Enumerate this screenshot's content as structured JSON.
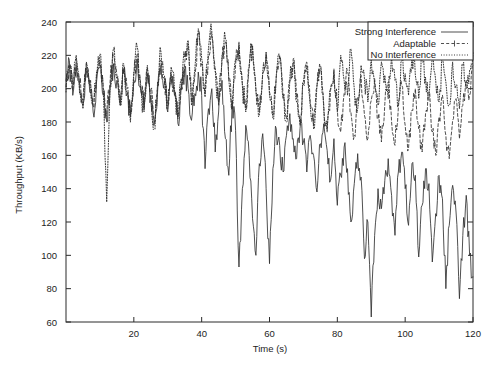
{
  "chart_data": {
    "type": "line",
    "title": "",
    "xlabel": "Time (s)",
    "ylabel": "Throughput (KB/s)",
    "xlim": [
      0,
      120
    ],
    "ylim": [
      60,
      240
    ],
    "xticks": [
      20,
      40,
      60,
      80,
      100,
      120
    ],
    "yticks": [
      60,
      80,
      100,
      120,
      140,
      160,
      180,
      200,
      220,
      240
    ],
    "grid": false,
    "legend_position": "top-right",
    "series": [
      {
        "name": "Strong Interference",
        "style": "solid",
        "color": "#303030",
        "x": [
          0,
          1,
          2,
          3,
          4,
          5,
          6,
          7,
          8,
          9,
          10,
          11,
          12,
          13,
          14,
          15,
          16,
          17,
          18,
          19,
          20,
          21,
          22,
          23,
          24,
          25,
          26,
          27,
          28,
          29,
          30,
          31,
          32,
          33,
          34,
          35,
          36,
          37,
          38,
          39,
          40,
          41,
          42,
          43,
          44,
          45,
          46,
          47,
          48,
          49,
          50,
          51,
          52,
          53,
          54,
          55,
          56,
          57,
          58,
          59,
          60,
          61,
          62,
          63,
          64,
          65,
          66,
          67,
          68,
          69,
          70,
          71,
          72,
          73,
          74,
          75,
          76,
          77,
          78,
          79,
          80,
          81,
          82,
          83,
          84,
          85,
          86,
          87,
          88,
          89,
          90,
          91,
          92,
          93,
          94,
          95,
          96,
          97,
          98,
          99,
          100,
          101,
          102,
          103,
          104,
          105,
          106,
          107,
          108,
          109,
          110,
          111,
          112,
          113,
          114,
          115,
          116,
          117,
          118,
          119,
          120
        ],
        "values": [
          205,
          217,
          196,
          214,
          200,
          190,
          211,
          198,
          186,
          204,
          213,
          196,
          180,
          200,
          215,
          205,
          190,
          209,
          197,
          183,
          205,
          218,
          200,
          188,
          209,
          196,
          178,
          198,
          214,
          203,
          186,
          207,
          196,
          179,
          199,
          212,
          200,
          181,
          197,
          210,
          196,
          152,
          188,
          200,
          162,
          186,
          205,
          170,
          148,
          193,
          175,
          93,
          140,
          178,
          160,
          122,
          100,
          155,
          173,
          140,
          95,
          152,
          176,
          166,
          150,
          172,
          185,
          170,
          158,
          176,
          168,
          150,
          172,
          160,
          138,
          167,
          179,
          163,
          145,
          170,
          130,
          148,
          165,
          152,
          120,
          143,
          161,
          147,
          98,
          120,
          63,
          112,
          140,
          128,
          145,
          158,
          136,
          112,
          150,
          162,
          140,
          118,
          155,
          148,
          99,
          130,
          152,
          143,
          96,
          125,
          148,
          134,
          80,
          118,
          142,
          126,
          74,
          112,
          136,
          100,
          87
        ]
      },
      {
        "name": "Adaptable",
        "style": "dashed",
        "color": "#303030",
        "x": [
          0,
          1,
          2,
          3,
          4,
          5,
          6,
          7,
          8,
          9,
          10,
          11,
          12,
          13,
          14,
          15,
          16,
          17,
          18,
          19,
          20,
          21,
          22,
          23,
          24,
          25,
          26,
          27,
          28,
          29,
          30,
          31,
          32,
          33,
          34,
          35,
          36,
          37,
          38,
          39,
          40,
          41,
          42,
          43,
          44,
          45,
          46,
          47,
          48,
          49,
          50,
          51,
          52,
          53,
          54,
          55,
          56,
          57,
          58,
          59,
          60,
          61,
          62,
          63,
          64,
          65,
          66,
          67,
          68,
          69,
          70,
          71,
          72,
          73,
          74,
          75,
          76,
          77,
          78,
          79,
          80,
          81,
          82,
          83,
          84,
          85,
          86,
          87,
          88,
          89,
          90,
          91,
          92,
          93,
          94,
          95,
          96,
          97,
          98,
          99,
          100,
          101,
          102,
          103,
          104,
          105,
          106,
          107,
          108,
          109,
          110,
          111,
          112,
          113,
          114,
          115,
          116,
          117,
          118,
          119,
          120
        ],
        "values": [
          201,
          213,
          199,
          218,
          203,
          193,
          215,
          202,
          190,
          208,
          217,
          200,
          184,
          204,
          219,
          208,
          192,
          212,
          200,
          186,
          208,
          221,
          203,
          191,
          212,
          199,
          181,
          201,
          217,
          206,
          190,
          210,
          199,
          183,
          203,
          215,
          227,
          192,
          208,
          233,
          215,
          197,
          220,
          231,
          210,
          192,
          217,
          228,
          205,
          190,
          214,
          226,
          203,
          188,
          212,
          224,
          200,
          186,
          209,
          222,
          198,
          184,
          207,
          220,
          196,
          182,
          205,
          218,
          194,
          180,
          203,
          216,
          192,
          178,
          201,
          214,
          190,
          176,
          199,
          212,
          188,
          174,
          197,
          210,
          186,
          172,
          195,
          208,
          184,
          170,
          193,
          206,
          182,
          168,
          191,
          204,
          180,
          166,
          189,
          202,
          178,
          164,
          187,
          200,
          176,
          162,
          185,
          198,
          174,
          160,
          183,
          196,
          172,
          158,
          181,
          194,
          170,
          190,
          205,
          196,
          214
        ]
      },
      {
        "name": "No Interference",
        "style": "dotted",
        "color": "#303030",
        "x": [
          0,
          1,
          2,
          3,
          4,
          5,
          6,
          7,
          8,
          9,
          10,
          11,
          12,
          13,
          14,
          15,
          16,
          17,
          18,
          19,
          20,
          21,
          22,
          23,
          24,
          25,
          26,
          27,
          28,
          29,
          30,
          31,
          32,
          33,
          34,
          35,
          36,
          37,
          38,
          39,
          40,
          41,
          42,
          43,
          44,
          45,
          46,
          47,
          48,
          49,
          50,
          51,
          52,
          53,
          54,
          55,
          56,
          57,
          58,
          59,
          60,
          61,
          62,
          63,
          64,
          65,
          66,
          67,
          68,
          69,
          70,
          71,
          72,
          73,
          74,
          75,
          76,
          77,
          78,
          79,
          80,
          81,
          82,
          83,
          84,
          85,
          86,
          87,
          88,
          89,
          90,
          91,
          92,
          93,
          94,
          95,
          96,
          97,
          98,
          99,
          100,
          101,
          102,
          103,
          104,
          105,
          106,
          107,
          108,
          109,
          110,
          111,
          112,
          113,
          114,
          115,
          116,
          117,
          118,
          119,
          120
        ],
        "values": [
          198,
          212,
          203,
          220,
          197,
          188,
          216,
          205,
          193,
          210,
          221,
          198,
          132,
          202,
          224,
          206,
          190,
          215,
          198,
          180,
          210,
          225,
          200,
          186,
          214,
          198,
          176,
          204,
          222,
          208,
          188,
          213,
          199,
          182,
          206,
          219,
          229,
          190,
          212,
          236,
          218,
          195,
          224,
          234,
          212,
          190,
          220,
          230,
          206,
          188,
          218,
          228,
          202,
          186,
          214,
          226,
          198,
          184,
          210,
          221,
          196,
          182,
          208,
          218,
          194,
          180,
          206,
          216,
          192,
          178,
          204,
          214,
          190,
          176,
          202,
          212,
          188,
          174,
          200,
          210,
          186,
          220,
          205,
          196,
          224,
          200,
          188,
          214,
          206,
          192,
          218,
          203,
          190,
          216,
          208,
          194,
          220,
          205,
          191,
          217,
          209,
          196,
          222,
          208,
          194,
          220,
          207,
          193,
          219,
          205,
          192,
          218,
          204,
          190,
          216,
          202,
          188,
          214,
          200,
          211,
          222
        ]
      }
    ]
  },
  "legend": {
    "entries": [
      {
        "label": "Strong Interference",
        "style": "solid"
      },
      {
        "label": "Adaptable",
        "style": "dashed"
      },
      {
        "label": "No Interference",
        "style": "dotted"
      }
    ]
  },
  "axes": {
    "x_label": "Time (s)",
    "y_label": "Throughput (KB/s)",
    "x_tick_labels": [
      "20",
      "40",
      "60",
      "80",
      "100",
      "120"
    ],
    "y_tick_labels": [
      "60",
      "80",
      "100",
      "120",
      "140",
      "160",
      "180",
      "200",
      "220",
      "240"
    ]
  },
  "colors": {
    "line": "#303030",
    "frame": "#2b2b2b",
    "background": "#ffffff",
    "text": "#1d1d1d"
  }
}
